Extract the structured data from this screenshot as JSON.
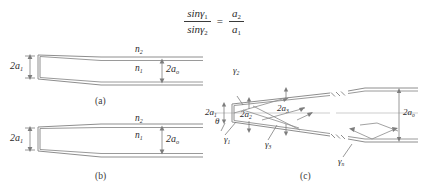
{
  "figure": {
    "title_formula": {
      "numerator_left": "sinγ",
      "numerator_left_sub": "1",
      "denominator_left": "sinγ",
      "denominator_left_sub": "2",
      "equals": "=",
      "numerator_right": "a",
      "numerator_right_sub": "2",
      "denominator_right": "a",
      "denominator_right_sub": "1"
    },
    "captions": {
      "a": "(a)",
      "b": "(b)",
      "c": "(c)"
    },
    "panel_a": {
      "left_dim": "2a",
      "left_dim_sub": "1",
      "right_dim": "2a",
      "right_dim_sub": "o",
      "index_outer": "n",
      "index_outer_sub": "2",
      "index_inner": "n",
      "index_inner_sub": "1"
    },
    "panel_b": {
      "left_dim": "2a",
      "left_dim_sub": "1",
      "right_dim": "2a",
      "right_dim_sub": "o",
      "index_outer": "n",
      "index_outer_sub": "2",
      "index_inner": "n",
      "index_inner_sub": "1"
    },
    "panel_c": {
      "left_dim": "2a",
      "left_dim_sub": "1",
      "dim_a2": "2a",
      "dim_a2_sub": "2",
      "dim_a3": "2a",
      "dim_a3_sub": "3",
      "right_dim": "2a",
      "right_dim_sub": "o",
      "angle_theta": "θ",
      "angle_g1": "γ",
      "angle_g1_sub": "1",
      "angle_g2": "γ",
      "angle_g2_sub": "2",
      "angle_g3": "γ",
      "angle_g3_sub": "3",
      "angle_gn": "γ",
      "angle_gn_sub": "n"
    }
  },
  "colors": {
    "line": "#8e8e8e",
    "dim": "#7d7d7d",
    "axis": "#b8b8b8",
    "text": "#2b2b2b"
  }
}
